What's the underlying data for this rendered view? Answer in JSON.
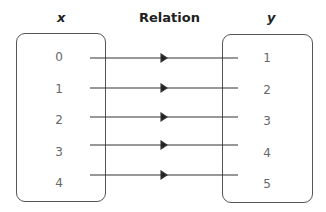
{
  "headers": {
    "domain": "x",
    "relation": "Relation",
    "range": "y"
  },
  "domain_values": [
    "0",
    "1",
    "2",
    "3",
    "4"
  ],
  "range_values": [
    "1",
    "2",
    "3",
    "4",
    "5"
  ],
  "mappings": [
    {
      "from": "0",
      "to": "1"
    },
    {
      "from": "1",
      "to": "2"
    },
    {
      "from": "2",
      "to": "3"
    },
    {
      "from": "3",
      "to": "4"
    },
    {
      "from": "4",
      "to": "5"
    }
  ]
}
